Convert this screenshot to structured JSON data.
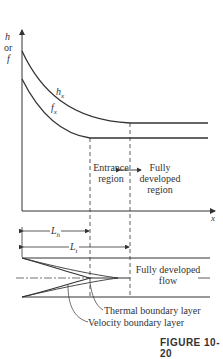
{
  "figure": {
    "caption": "FIGURE 10-20",
    "axes": {
      "y_label_line1": "h",
      "y_label_line2": "or",
      "y_label_line3": "f",
      "x_label": "x"
    },
    "curves": {
      "h_label": "h",
      "h_sub": "x",
      "f_label": "f",
      "f_sub": "x"
    },
    "regions": {
      "entrance_line1": "Entrance",
      "entrance_line2": "region",
      "developed_line1": "Fully",
      "developed_line2": "developed",
      "developed_line3": "region"
    },
    "lengths": {
      "hydrodynamic": "L",
      "hydrodynamic_sub": "h",
      "thermal": "L",
      "thermal_sub": "t"
    },
    "pipe": {
      "flow_line1": "Fully developed",
      "flow_line2": "flow",
      "thermal_layer": "Thermal boundary layer",
      "velocity_layer": "Velocity boundary layer"
    }
  }
}
